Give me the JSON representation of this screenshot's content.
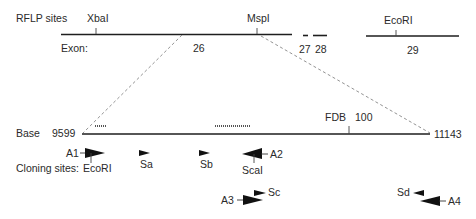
{
  "rflp": {
    "label": "RFLP sites",
    "sites": [
      {
        "name": "XbaI",
        "label": "XbaI"
      },
      {
        "name": "MspI",
        "label": "MspI"
      },
      {
        "name": "EcoRI",
        "label": "EcoRI"
      }
    ]
  },
  "exons": {
    "label": "Exon:",
    "items": [
      "26",
      "27",
      "28",
      "29"
    ]
  },
  "base": {
    "label": "Base",
    "start": "9599",
    "end": "11143",
    "fdb_label": "FDB",
    "fdb_value": "100"
  },
  "primers": [
    {
      "id": "A1",
      "label": "A1",
      "direction": "forward"
    },
    {
      "id": "Sa",
      "label": "Sa",
      "direction": "forward"
    },
    {
      "id": "Sb",
      "label": "Sb",
      "direction": "forward"
    },
    {
      "id": "A2",
      "label": "A2",
      "direction": "reverse"
    },
    {
      "id": "A3",
      "label": "A3",
      "direction": "forward"
    },
    {
      "id": "Sc",
      "label": "Sc",
      "direction": "forward"
    },
    {
      "id": "Sd",
      "label": "Sd",
      "direction": "reverse"
    },
    {
      "id": "A4",
      "label": "A4",
      "direction": "reverse"
    }
  ],
  "cloning": {
    "label": "Cloning sites:",
    "sites": [
      "EcoRI",
      "ScaI"
    ]
  }
}
